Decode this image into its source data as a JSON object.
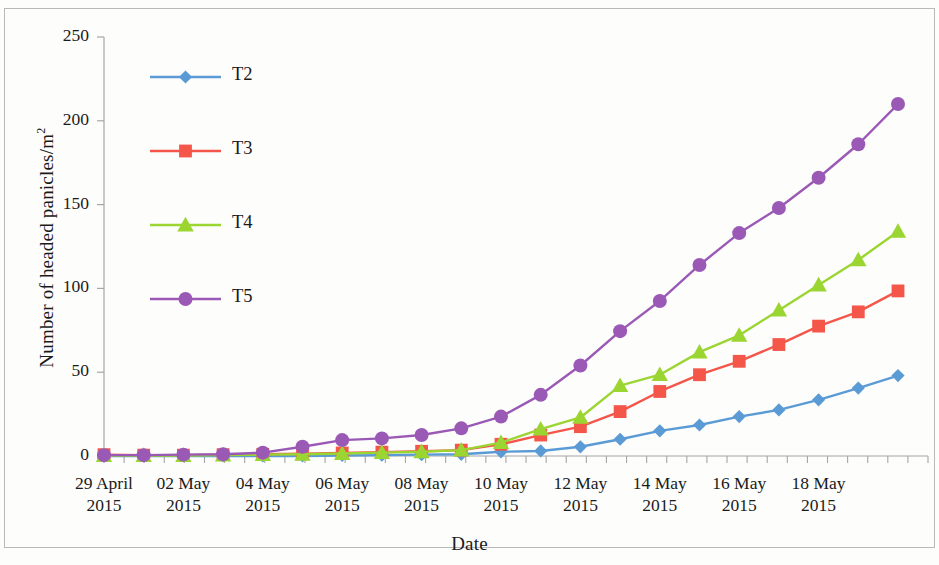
{
  "chart_data": {
    "type": "line",
    "title": "",
    "xlabel": "Date",
    "ylabel": "Number of headed panicles/m²",
    "ylabel_base": "Number of headed panicles/m",
    "ylabel_sup": "2",
    "ylim": [
      0,
      250
    ],
    "yticks": [
      0,
      50,
      100,
      150,
      200,
      250
    ],
    "ytick_labels": [
      "0",
      "50",
      "100",
      "150",
      "200",
      "250"
    ],
    "grid": false,
    "legend_position": "upper left inside plot",
    "x": [
      "29 April 2015",
      "30 April 2015",
      "01 May 2015",
      "02 May 2015",
      "03 May 2015",
      "04 May 2015",
      "05 May 2015",
      "06 May 2015",
      "07 May 2015",
      "08 May 2015",
      "09 May 2015",
      "10 May 2015",
      "11 May 2015",
      "12 May 2015",
      "13 May 2015",
      "14 May 2015",
      "15 May 2015",
      "16 May 2015",
      "17 May 2015",
      "18 May 2015",
      "19 May 2015"
    ],
    "xtick_labels": [
      {
        "line1": "29 April",
        "line2": "2015"
      },
      {
        "line1": "02 May",
        "line2": "2015"
      },
      {
        "line1": "04 May",
        "line2": "2015"
      },
      {
        "line1": "06 May",
        "line2": "2015"
      },
      {
        "line1": "08 May",
        "line2": "2015"
      },
      {
        "line1": "10 May",
        "line2": "2015"
      },
      {
        "line1": "12 May",
        "line2": "2015"
      },
      {
        "line1": "14 May",
        "line2": "2015"
      },
      {
        "line1": "16 May",
        "line2": "2015"
      },
      {
        "line1": "18 May",
        "line2": "2015"
      }
    ],
    "xtick_label_indices": [
      0,
      2,
      4,
      6,
      8,
      10,
      12,
      14,
      16,
      18
    ],
    "series": [
      {
        "name": "T2",
        "color": "#5B9BD5",
        "marker": "diamond",
        "values": [
          0,
          0,
          0,
          0,
          0,
          0,
          0.3,
          0.5,
          0.8,
          1,
          2.5,
          3,
          5.5,
          10,
          15,
          18.5,
          23.5,
          27.5,
          33.5,
          40.5,
          48
        ]
      },
      {
        "name": "T3",
        "color": "#F4564A",
        "marker": "square",
        "values": [
          0.8,
          0.5,
          0.5,
          0.8,
          1,
          1.3,
          1.8,
          2.3,
          2.8,
          3.5,
          7,
          12.5,
          17.5,
          26.5,
          38.5,
          48.5,
          56.5,
          66.5,
          77.5,
          86,
          98.5
        ]
      },
      {
        "name": "T4",
        "color": "#9BD531",
        "marker": "triangle",
        "values": [
          0.3,
          0.3,
          0.3,
          0.5,
          0.8,
          1,
          1.5,
          2,
          2.5,
          3.5,
          8,
          16,
          23,
          42,
          48.5,
          62,
          72,
          87,
          102,
          117,
          134
        ]
      },
      {
        "name": "T5",
        "color": "#9B59B6",
        "marker": "circle",
        "values": [
          0.5,
          0.5,
          0.8,
          1,
          2,
          5.5,
          9.5,
          10.5,
          12.5,
          16.5,
          23.5,
          36.5,
          54,
          74.5,
          92.5,
          114,
          133,
          148,
          166,
          186,
          210
        ]
      }
    ],
    "legend": [
      {
        "label": "T2",
        "color": "#5B9BD5",
        "marker": "diamond"
      },
      {
        "label": "T3",
        "color": "#F4564A",
        "marker": "square"
      },
      {
        "label": "T4",
        "color": "#9BD531",
        "marker": "triangle"
      },
      {
        "label": "T5",
        "color": "#9B59B6",
        "marker": "circle"
      }
    ],
    "axis_color": "#a6a6a6"
  }
}
